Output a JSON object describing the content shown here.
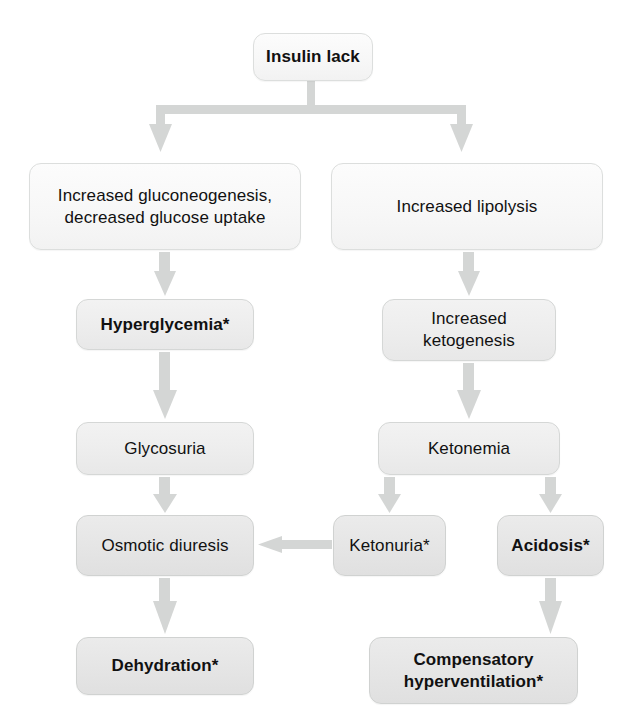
{
  "diagram": {
    "footnote_marker": "*",
    "colors": {
      "arrow": "#d3d5d4",
      "node_border": "#d7d9d8",
      "node_fill_light": "#f7f7f7",
      "node_fill_mid": "#ededed",
      "node_fill_dark": "#e5e5e5",
      "text": "#111111",
      "background": "#ffffff"
    },
    "nodes": [
      {
        "id": "insulin-lack",
        "label": "Insulin lack",
        "bold": true,
        "shade": "light",
        "x": 253,
        "y": 33,
        "w": 120,
        "h": 48
      },
      {
        "id": "increased-gluconeogenesis",
        "label": "Increased gluconeogenesis,\ndecreased glucose uptake",
        "bold": false,
        "shade": "light",
        "x": 29,
        "y": 163,
        "w": 272,
        "h": 87
      },
      {
        "id": "increased-lipolysis",
        "label": "Increased lipolysis",
        "bold": false,
        "shade": "light",
        "x": 331,
        "y": 163,
        "w": 272,
        "h": 87
      },
      {
        "id": "hyperglycemia",
        "label": "Hyperglycemia*",
        "bold": true,
        "shade": "mid",
        "x": 76,
        "y": 299,
        "w": 178,
        "h": 51
      },
      {
        "id": "increased-ketogenesis",
        "label": "Increased\nketogenesis",
        "bold": false,
        "shade": "mid",
        "x": 382,
        "y": 299,
        "w": 174,
        "h": 62
      },
      {
        "id": "glycosuria",
        "label": "Glycosuria",
        "bold": false,
        "shade": "mid",
        "x": 76,
        "y": 422,
        "w": 178,
        "h": 53
      },
      {
        "id": "ketonemia",
        "label": "Ketonemia",
        "bold": false,
        "shade": "mid",
        "x": 378,
        "y": 422,
        "w": 182,
        "h": 53
      },
      {
        "id": "osmotic-diuresis",
        "label": "Osmotic diuresis",
        "bold": false,
        "shade": "dark",
        "x": 76,
        "y": 515,
        "w": 178,
        "h": 61
      },
      {
        "id": "ketonuria",
        "label": "Ketonuria*",
        "bold": false,
        "shade": "dark",
        "x": 333,
        "y": 515,
        "w": 113,
        "h": 61
      },
      {
        "id": "acidosis",
        "label": "Acidosis*",
        "bold": true,
        "shade": "dark",
        "x": 497,
        "y": 515,
        "w": 107,
        "h": 61
      },
      {
        "id": "dehydration",
        "label": "Dehydration*",
        "bold": true,
        "shade": "dark",
        "x": 76,
        "y": 637,
        "w": 178,
        "h": 58
      },
      {
        "id": "compensatory-hyperventilation",
        "label": "Compensatory\nhyperventilation*",
        "bold": true,
        "shade": "dark",
        "x": 369,
        "y": 637,
        "w": 209,
        "h": 67
      }
    ],
    "edges": [
      {
        "id": "edge-insulin-split",
        "from": "insulin-lack",
        "to": [
          "increased-gluconeogenesis",
          "increased-lipolysis"
        ],
        "kind": "split-down"
      },
      {
        "id": "edge-gluconeo-to-hyperglycemia",
        "from": "increased-gluconeogenesis",
        "to": "hyperglycemia",
        "kind": "down"
      },
      {
        "id": "edge-lipolysis-to-ketogenesis",
        "from": "increased-lipolysis",
        "to": "increased-ketogenesis",
        "kind": "down"
      },
      {
        "id": "edge-hyperglycemia-to-glycosuria",
        "from": "hyperglycemia",
        "to": "glycosuria",
        "kind": "down"
      },
      {
        "id": "edge-ketogenesis-to-ketonemia",
        "from": "increased-ketogenesis",
        "to": "ketonemia",
        "kind": "down"
      },
      {
        "id": "edge-glycosuria-to-osmotic",
        "from": "glycosuria",
        "to": "osmotic-diuresis",
        "kind": "down"
      },
      {
        "id": "edge-ketonemia-to-ketonuria",
        "from": "ketonemia",
        "to": "ketonuria",
        "kind": "down"
      },
      {
        "id": "edge-ketonemia-to-acidosis",
        "from": "ketonemia",
        "to": "acidosis",
        "kind": "down"
      },
      {
        "id": "edge-ketonuria-to-osmotic",
        "from": "ketonuria",
        "to": "osmotic-diuresis",
        "kind": "left"
      },
      {
        "id": "edge-osmotic-to-dehydration",
        "from": "osmotic-diuresis",
        "to": "dehydration",
        "kind": "down"
      },
      {
        "id": "edge-acidosis-to-hyperventilation",
        "from": "acidosis",
        "to": "compensatory-hyperventilation",
        "kind": "down"
      }
    ]
  }
}
